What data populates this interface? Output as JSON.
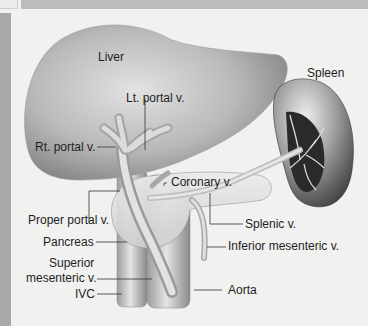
{
  "figure": {
    "labels": {
      "liver": "Liver",
      "spleen": "Spleen",
      "lt_portal": "Lt. portal v.",
      "rt_portal": "Rt. portal v.",
      "coronary": "Coronary v.",
      "proper_portal": "Proper portal v.",
      "splenic": "Splenic v.",
      "pancreas": "Pancreas",
      "inferior_mesenteric": "Inferior mesenteric v.",
      "superior_mesenteric_1": "Superior",
      "superior_mesenteric_2": "mesenteric v.",
      "ivc": "IVC",
      "aorta": "Aorta"
    },
    "colors": {
      "background": "#f1f1f0",
      "topbar": "#bcbcbb",
      "leftstrip": "#a9a9a8",
      "organ_dark": "#6f6f6f",
      "organ_light": "#dcdcdc",
      "leader_line": "#333333"
    }
  }
}
